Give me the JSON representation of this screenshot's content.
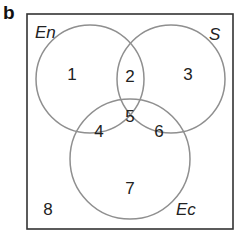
{
  "panel_label": "b",
  "sets": [
    {
      "name": "En",
      "label": "En"
    },
    {
      "name": "S",
      "label": "S"
    },
    {
      "name": "Ec",
      "label": "Ec"
    }
  ],
  "regions": {
    "r1": "1",
    "r2": "2",
    "r3": "3",
    "r4": "4",
    "r5": "5",
    "r6": "6",
    "r7": "7",
    "r8": "8"
  },
  "colors": {
    "frame": "#333333",
    "circle": "#8f8f8f",
    "text": "#222222"
  }
}
